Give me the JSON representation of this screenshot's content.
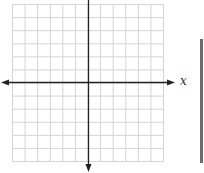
{
  "graph": {
    "type": "coordinate-plane",
    "grid_columns": 12,
    "grid_rows": 12,
    "x_axis_label": "x",
    "grid_color": "#d4d4d4",
    "axis_color": "#222222"
  },
  "side_bar": {
    "color": "#6b6b6b"
  }
}
